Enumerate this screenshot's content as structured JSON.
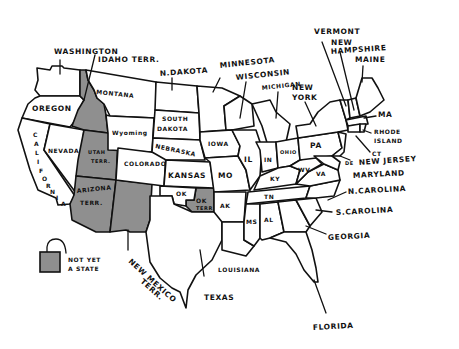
{
  "colors": {
    "territory_fill": "#8f8f8f",
    "state_fill": "#ffffff",
    "outline": "#111111"
  },
  "legend": {
    "line1": "NOT YET",
    "line2": "A STATE"
  },
  "labels": {
    "washington": "WASHINGTON",
    "idaho": "IDAHO TERR.",
    "oregon": "OREGON",
    "montana": "MONTANA",
    "california": [
      "C",
      "A",
      "L",
      "I",
      "F",
      "O",
      "R",
      "N",
      "I",
      "A"
    ],
    "nevada": "NEVADA",
    "utah_1": "UTAH",
    "utah_2": "TERR.",
    "arizona_1": "ARIZONA",
    "arizona_2": "TERR.",
    "wyoming": "Wyoming",
    "colorado": "COLORADO",
    "n_dakota": "N.DAKOTA",
    "s_dakota_1": "SOUTH",
    "s_dakota_2": "DAKOTA",
    "nebraska": "NEBRASKA",
    "kansas": "KANSAS",
    "ok": "OK",
    "ok_terr_1": "OK",
    "ok_terr_2": "TERR",
    "new_mexico_1": "NEW MEXICO",
    "new_mexico_2": "TERR.",
    "texas": "TEXAS",
    "minnesota": "MINNESOTA",
    "wisconsin": "WISCONSIN",
    "michigan": "MICHIGAN",
    "iowa": "IOWA",
    "mo": "MO",
    "ak": "AK",
    "louisiana": "LOUISIANA",
    "ms": "MS",
    "al": "AL",
    "tn": "TN",
    "ky": "KY",
    "il": "IL",
    "in": "IN",
    "ohio": "OHIO",
    "wv": "WV",
    "va": "VA",
    "pa": "PA",
    "new_york_1": "NEW",
    "new_york_2": "YORK",
    "vermont": "VERMONT",
    "new_hampshire_1": "NEW",
    "new_hampshire_2": "HAMPSHIRE",
    "maine": "MAINE",
    "ma": "MA",
    "rhode_island_1": "RHODE",
    "rhode_island_2": "ISLAND",
    "ct": "CT",
    "de": "DE",
    "new_jersey": "NEW JERSEY",
    "maryland": "MARYLAND",
    "n_carolina": "N.CAROLINA",
    "s_carolina": "S.CAROLINA",
    "georgia": "GEORGIA",
    "florida": "FLORIDA"
  },
  "territories_not_yet_states": [
    "Idaho Terr.",
    "Utah Terr.",
    "Arizona Terr.",
    "New Mexico Terr.",
    "OK Terr."
  ]
}
